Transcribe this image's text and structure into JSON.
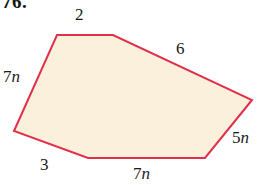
{
  "problem": {
    "number": "76."
  },
  "figure": {
    "type": "polygon",
    "sides": 6,
    "fill_color": "#faf0dc",
    "stroke_color": "#e0304a",
    "stroke_width": 2,
    "vertices": [
      [
        57,
        35
      ],
      [
        113,
        35
      ],
      [
        252,
        100
      ],
      [
        205,
        158
      ],
      [
        88,
        158
      ],
      [
        14,
        131
      ]
    ],
    "side_labels": [
      {
        "name": "top",
        "text": "2",
        "coefficient": "2",
        "variable": ""
      },
      {
        "name": "upper-right",
        "text": "6",
        "coefficient": "6",
        "variable": ""
      },
      {
        "name": "lower-right",
        "text": "5n",
        "coefficient": "5",
        "variable": "n"
      },
      {
        "name": "bottom",
        "text": "7n",
        "coefficient": "7",
        "variable": "n"
      },
      {
        "name": "bottom-left",
        "text": "3",
        "coefficient": "3",
        "variable": ""
      },
      {
        "name": "left",
        "text": "7n",
        "coefficient": "7",
        "variable": "n"
      }
    ]
  },
  "labels": {
    "top": {
      "coefficient": "2",
      "variable": ""
    },
    "upper_right": {
      "coefficient": "6",
      "variable": ""
    },
    "left": {
      "coefficient": "7",
      "variable": "n"
    },
    "lower_right": {
      "coefficient": "5",
      "variable": "n"
    },
    "bottom_left": {
      "coefficient": "3",
      "variable": ""
    },
    "bottom": {
      "coefficient": "7",
      "variable": "n"
    }
  }
}
